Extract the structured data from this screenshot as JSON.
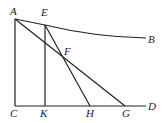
{
  "diagram": {
    "labels": {
      "A": "A",
      "B": "B",
      "C": "C",
      "D": "D",
      "E": "E",
      "F": "F",
      "G": "G",
      "H": "H",
      "K": "K"
    },
    "stroke_color": "#222222"
  }
}
